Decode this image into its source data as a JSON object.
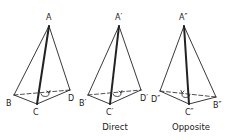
{
  "figures": [
    {
      "id": "original",
      "caption": "",
      "vertices": {
        "A": {
          "label": "A",
          "x": 49,
          "y": 26
        },
        "B": {
          "label": "B",
          "x": 14,
          "y": 95
        },
        "C": {
          "label": "C",
          "x": 37,
          "y": 104
        },
        "D": {
          "label": "D",
          "x": 70,
          "y": 90
        }
      },
      "orientation": "clockwise"
    },
    {
      "id": "direct",
      "caption": "Direct",
      "vertices": {
        "A": {
          "label": "A′",
          "x": 119,
          "y": 26
        },
        "B": {
          "label": "B′",
          "x": 88,
          "y": 95
        },
        "C": {
          "label": "C′",
          "x": 110,
          "y": 104
        },
        "D": {
          "label": "D′",
          "x": 141,
          "y": 90
        }
      },
      "orientation": "clockwise"
    },
    {
      "id": "opposite",
      "caption": "Opposite",
      "vertices": {
        "A": {
          "label": "A″",
          "x": 184,
          "y": 26
        },
        "B": {
          "label": "B″",
          "x": 216,
          "y": 97
        },
        "C": {
          "label": "C″",
          "x": 189,
          "y": 104
        },
        "D": {
          "label": "D″",
          "x": 160,
          "y": 91
        }
      },
      "orientation": "counterclockwise"
    }
  ],
  "colors": {
    "stroke": "#222222",
    "background": "#ffffff"
  }
}
